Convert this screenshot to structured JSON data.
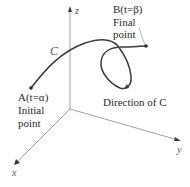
{
  "axes": {
    "x": "x",
    "y": "y",
    "z": "z"
  },
  "curve": {
    "name": "C"
  },
  "point_a": {
    "label": "A(t=α)",
    "caption_line1": "Initial",
    "caption_line2": "point"
  },
  "point_b": {
    "label": "B(t=β)",
    "caption_line1": "Final",
    "caption_line2": "point"
  },
  "direction_caption": "Direction of C",
  "colors": {
    "curve": "#3a3a3a",
    "axis": "#8a8a8a",
    "text": "#2a2a2a"
  }
}
